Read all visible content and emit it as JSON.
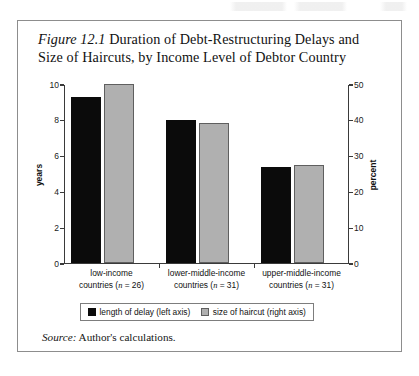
{
  "figure": {
    "number": "Figure 12.1",
    "title": "Duration of Debt-Restructuring Delays and Size of Haircuts, by Income Level of Debtor Country",
    "source_label": "Source:",
    "source_text": "Author's calculations."
  },
  "legend": {
    "delay_label": "length of delay (left axis)",
    "haircut_label": "size of haircut (right axis)"
  },
  "colors": {
    "delay": "#0b0b0b",
    "haircut": "#b0b0b0",
    "axis": "#3a3a3a",
    "border": "#8d8d8d"
  },
  "chart_data": {
    "type": "bar",
    "title": "Figure 12.1 Duration of Debt-Restructuring Delays and Size of Haircuts, by Income Level of Debtor Country",
    "categories": [
      "low-income countries (n = 26)",
      "lower-middle-income countries (n = 31)",
      "upper-middle-income countries (n = 31)"
    ],
    "category_lines": [
      [
        "low-income",
        "countries (n = 26)"
      ],
      [
        "lower-middle-income",
        "countries (n = 31)"
      ],
      [
        "upper-middle-income",
        "countries (n = 31)"
      ]
    ],
    "series": [
      {
        "name": "length of delay (left axis)",
        "axis": "left",
        "unit": "years",
        "color": "#0b0b0b",
        "values": [
          9.3,
          8.0,
          5.35
        ]
      },
      {
        "name": "size of haircut (right axis)",
        "axis": "right",
        "unit": "percent",
        "color": "#b0b0b0",
        "values": [
          50.0,
          39.2,
          27.3
        ]
      }
    ],
    "xlabel": "",
    "ylabel": "years",
    "y2label": "percent",
    "ylim": [
      0,
      10
    ],
    "y2lim": [
      0,
      50
    ],
    "yticks": [
      0,
      2,
      4,
      6,
      8,
      10
    ],
    "y2ticks": [
      0,
      10,
      20,
      30,
      40,
      50
    ],
    "ytick_labels": [
      "0",
      "2",
      "4",
      "6",
      "8",
      "10"
    ],
    "y2tick_labels": [
      "0",
      "10",
      "20",
      "30",
      "40",
      "50"
    ],
    "grid": false,
    "legend_position": "bottom"
  }
}
